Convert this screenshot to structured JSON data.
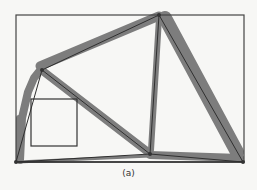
{
  "figure": {
    "caption": "(a)",
    "frame": {
      "x": 16,
      "y": 15,
      "width": 228,
      "height": 147,
      "stroke": "#444444"
    },
    "inset_box": {
      "x": 31,
      "y": 99,
      "width": 46,
      "height": 47,
      "stroke": "#333333"
    },
    "colors": {
      "band": "#7d7d7d",
      "member": "#2f2f2f",
      "node": "#333333",
      "background": "#f7f7f5"
    },
    "nodes": [
      {
        "id": "A",
        "x": 16,
        "y": 162
      },
      {
        "id": "B",
        "x": 42,
        "y": 70
      },
      {
        "id": "C",
        "x": 159,
        "y": 15
      },
      {
        "id": "D",
        "x": 150,
        "y": 154
      },
      {
        "id": "E",
        "x": 243,
        "y": 162
      }
    ],
    "members": [
      {
        "from": "A",
        "to": "B",
        "band_width": 7
      },
      {
        "from": "B",
        "to": "C",
        "band_width": 10
      },
      {
        "from": "B",
        "to": "D",
        "band_width": 9
      },
      {
        "from": "C",
        "to": "D",
        "band_width": 7
      },
      {
        "from": "C",
        "to": "E",
        "band_width": 14
      },
      {
        "from": "A",
        "to": "D",
        "band_width": 3
      },
      {
        "from": "D",
        "to": "E",
        "band_width": 9
      },
      {
        "from": "A",
        "to": "E",
        "band_width": 2
      }
    ]
  }
}
